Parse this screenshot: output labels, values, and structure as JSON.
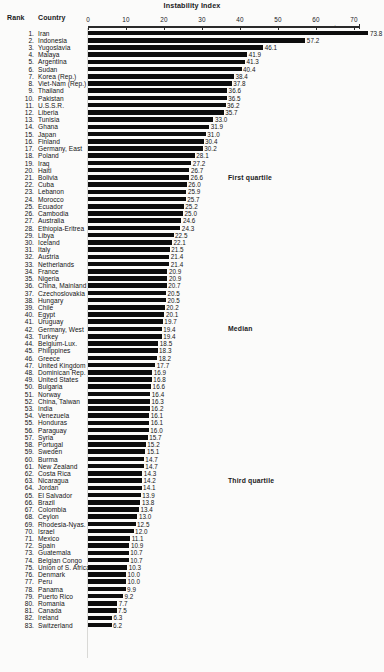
{
  "chart_data": {
    "type": "bar",
    "orientation": "horizontal",
    "title": "Instability Index",
    "xlabel": "",
    "ylabel": "",
    "xlim": [
      0,
      72
    ],
    "axis_ticks": [
      0,
      10,
      20,
      30,
      40,
      50,
      60,
      70
    ],
    "grid": false,
    "legend": null,
    "columns": [
      "Rank",
      "Country",
      "Instability Index"
    ],
    "annotations": [
      {
        "text": "First quartile",
        "at_rank": 21
      },
      {
        "text": "Median",
        "at_rank": 42
      },
      {
        "text": "Third quartile",
        "at_rank": 63
      }
    ],
    "categories": [
      "Iran",
      "Indonesia",
      "Yugoslavia",
      "Malaya",
      "Argentina",
      "Sudan",
      "Korea (Rep.)",
      "Viet-Nam (Rep.)",
      "Thailand",
      "Pakistan",
      "U.S.S.R.",
      "Liberia",
      "Tunisia",
      "Ghana",
      "Japan",
      "Finland",
      "Germany, East",
      "Poland",
      "Iraq",
      "Haiti",
      "Bolivia",
      "Cuba",
      "Lebanon",
      "Morocco",
      "Ecuador",
      "Cambodia",
      "Australia",
      "Ethiopia-Eritrea",
      "Libya",
      "Iceland",
      "Italy",
      "Austria",
      "Netherlands",
      "France",
      "Nigeria",
      "China, Mainland",
      "Czechoslovakia",
      "Hungary",
      "Chile",
      "Egypt",
      "Uruguay",
      "Germany, West",
      "Turkey",
      "Belgium-Lux.",
      "Philippines",
      "Greece",
      "United Kingdom",
      "Dominican Rep.",
      "United States",
      "Bulgaria",
      "Norway",
      "China, Taiwan",
      "India",
      "Venezuela",
      "Honduras",
      "Paraguay",
      "Syria",
      "Portugal",
      "Sweden",
      "Burma",
      "New Zealand",
      "Costa Rica",
      "Nicaragua",
      "Jordan",
      "El Salvador",
      "Brazil",
      "Colombia",
      "Ceylon",
      "Rhodesia-Nyas.",
      "Israel",
      "Mexico",
      "Spain",
      "Guatemala",
      "Belgian Congo",
      "Union of S. Africa",
      "Denmark",
      "Peru",
      "Panama",
      "Puerto Rico",
      "Romania",
      "Canada",
      "Ireland",
      "Switzerland"
    ],
    "values": [
      73.8,
      57.2,
      46.1,
      41.9,
      41.3,
      40.4,
      38.4,
      37.8,
      36.6,
      36.5,
      36.2,
      35.7,
      33.0,
      31.9,
      31.0,
      30.4,
      30.2,
      28.1,
      27.2,
      26.7,
      26.6,
      26.0,
      25.9,
      25.7,
      25.2,
      25.0,
      24.6,
      24.3,
      22.5,
      22.1,
      21.5,
      21.4,
      21.4,
      20.9,
      20.9,
      20.7,
      20.5,
      20.5,
      20.2,
      20.1,
      19.7,
      19.4,
      19.4,
      18.5,
      18.3,
      18.2,
      17.7,
      16.9,
      16.8,
      16.6,
      16.4,
      16.3,
      16.2,
      16.1,
      16.1,
      16.0,
      15.7,
      15.2,
      15.1,
      14.7,
      14.7,
      14.3,
      14.2,
      14.1,
      13.9,
      13.8,
      13.4,
      13.0,
      12.5,
      12.0,
      11.1,
      10.9,
      10.7,
      10.7,
      10.3,
      10.0,
      10.0,
      9.9,
      9.2,
      7.7,
      7.5,
      6.3,
      6.2
    ],
    "value_labels": [
      "73.8",
      "57.2",
      "46.1",
      "41.9",
      "41.3",
      "40.4",
      "38.4",
      "37.8",
      "36.6",
      "36.5",
      "36.2",
      "35.7",
      "33.0",
      "31.9",
      "31.0",
      "30.4",
      "30.2",
      "28.1",
      "27.2",
      "26.7",
      "26.6",
      "26.0",
      "25.9",
      "25.7",
      "25.2",
      "25.0",
      "24.6",
      "24.3",
      "22.5",
      "22.1",
      "21.5",
      "21.4",
      "21.4",
      "20.9",
      "20.9",
      "20.7",
      "20.5",
      "20.5",
      "20.2",
      "20.1",
      "19.7",
      "19.4",
      "19.4",
      "18.5",
      "18.3",
      "18.2",
      "17.7",
      "16.9",
      "16.8",
      "16.6",
      "16.4",
      "16.3",
      "16.2",
      "16.1",
      "16.1",
      "16.0",
      "15.7",
      "15.2",
      "15.1",
      "14.7",
      "14.7",
      "14.3",
      "14.2",
      "14.1",
      "13.9",
      "13.8",
      "13.4",
      "13.0",
      "12.5",
      "12.0",
      "11.1",
      "10.9",
      "10.7",
      "10.7",
      "10.3",
      "10.0",
      "10.0",
      "9.9",
      "9.2",
      "7.7",
      "7.5",
      "6.3",
      "6.2"
    ],
    "bar_color": "#0d0d0d",
    "background_color": "#fbfbfa"
  },
  "header": {
    "rank_label": "Rank",
    "country_label": "Country"
  }
}
